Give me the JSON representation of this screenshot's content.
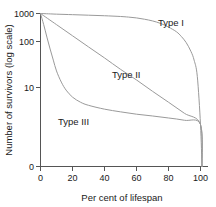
{
  "chart_data": {
    "type": "line",
    "title": "",
    "subtitle": "",
    "xlabel": "Per cent of lifespan",
    "ylabel": "Number of survivors (log scale)",
    "xlim": [
      0,
      100
    ],
    "ylim": [
      0,
      1000
    ],
    "yscale": "log",
    "grid": false,
    "legend_position": "inline-annotations",
    "xticks": [
      {
        "value": 0,
        "label": "0"
      },
      {
        "value": 20,
        "label": "20"
      },
      {
        "value": 40,
        "label": "40"
      },
      {
        "value": 60,
        "label": "60"
      },
      {
        "value": 80,
        "label": "80"
      },
      {
        "value": 100,
        "label": "100"
      }
    ],
    "yticks": [
      {
        "value": 1000,
        "label": "1000"
      },
      {
        "value": 100,
        "label": "100"
      },
      {
        "value": 10,
        "label": "10"
      },
      {
        "value": 0,
        "label": "0"
      }
    ],
    "annotations": [
      {
        "text": "Type I",
        "x": 78,
        "y": 600
      },
      {
        "text": "Type II",
        "x": 52,
        "y": 40
      },
      {
        "text": "Type III",
        "x": 14,
        "y": 4.5
      }
    ],
    "series": [
      {
        "name": "Type I",
        "label": "Type I",
        "color": "#9a9a9a",
        "x": [
          0,
          5,
          10,
          20,
          30,
          40,
          50,
          55,
          60,
          65,
          70,
          75,
          80,
          85,
          88,
          91,
          94,
          96,
          98,
          100
        ],
        "values": [
          1000,
          980,
          960,
          930,
          900,
          870,
          830,
          800,
          760,
          700,
          630,
          540,
          430,
          320,
          240,
          165,
          95,
          55,
          20,
          1
        ]
      },
      {
        "name": "Type II",
        "label": "Type II",
        "color": "#9a9a9a",
        "x": [
          0,
          10,
          20,
          30,
          40,
          50,
          60,
          70,
          80,
          90,
          100
        ],
        "values": [
          1000,
          500,
          250,
          125,
          63,
          31,
          16,
          7.9,
          4.0,
          2.0,
          1
        ]
      },
      {
        "name": "Type III",
        "label": "Type III",
        "color": "#9a9a9a",
        "x": [
          0,
          2,
          4,
          6,
          8,
          10,
          13,
          16,
          20,
          25,
          30,
          40,
          50,
          60,
          70,
          80,
          90,
          100
        ],
        "values": [
          1000,
          500,
          230,
          110,
          55,
          28,
          14,
          8.5,
          5.5,
          4.0,
          3.3,
          2.6,
          2.2,
          1.9,
          1.7,
          1.5,
          1.3,
          1
        ]
      }
    ]
  }
}
